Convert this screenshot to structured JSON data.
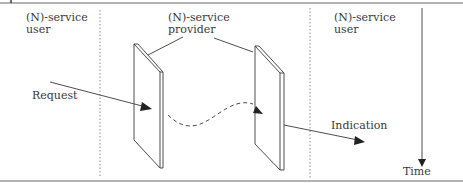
{
  "diagram": {
    "labels": {
      "user_left_line1": "(N)-service",
      "user_left_line2": "user",
      "provider_line1": "(N)-service",
      "provider_line2": "provider",
      "user_right_line1": "(N)-service",
      "user_right_line2": "user",
      "request": "Request",
      "indication": "Indication",
      "time": "Time"
    },
    "colors": {
      "line": "#3a3a3a",
      "divider": "#8a8a8a",
      "frame": "#6a6a6a"
    }
  }
}
